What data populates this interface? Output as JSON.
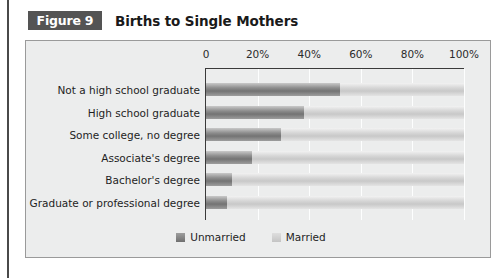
{
  "figure": {
    "tag_label": "Figure 9",
    "title": "Births to Single Mothers"
  },
  "legend": {
    "position": "bottom-center",
    "items": [
      {
        "label": "Unmarried",
        "swatch": "dark-gray-swatch"
      },
      {
        "label": "Married",
        "swatch": "light-gray-swatch"
      }
    ]
  },
  "colors": {
    "tag_background": "#545454",
    "panel_background": "#eceded",
    "panel_border": "#9a9a9a",
    "left_rule": "#4a4a4a",
    "unmarried": "#7f7f7f",
    "married": "#d2d2d2",
    "axis": "#3a3a3a",
    "gridline": "#ffffff"
  },
  "chart_data": {
    "type": "bar",
    "orientation": "horizontal",
    "stacked": true,
    "title": "Births to Single Mothers",
    "xlabel": "",
    "ylabel": "",
    "xlim": [
      0,
      100
    ],
    "xticks": [
      0,
      20,
      40,
      60,
      80,
      100
    ],
    "xtick_labels": [
      "0",
      "20%",
      "40%",
      "60%",
      "80%",
      "100%"
    ],
    "grid": true,
    "legend_position": "bottom-center",
    "categories": [
      "Not a high school graduate",
      "High school graduate",
      "Some college, no degree",
      "Associate's degree",
      "Bachelor's degree",
      "Graduate or professional degree"
    ],
    "series": [
      {
        "name": "Unmarried",
        "values": [
          52,
          38,
          29,
          18,
          10,
          8
        ]
      },
      {
        "name": "Married",
        "values": [
          48,
          62,
          71,
          82,
          90,
          92
        ]
      }
    ]
  }
}
